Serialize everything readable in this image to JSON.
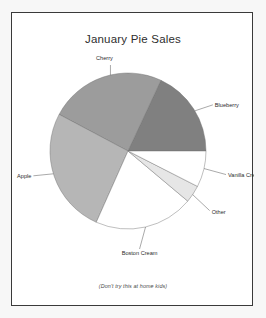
{
  "figure": {
    "title": "January Pie Sales",
    "footnote": "(Don't try this at home kids)",
    "background": "#f7f7f7",
    "panel_background": "#ffffff",
    "border_color": "#3a3a3a"
  },
  "chart_data": {
    "type": "pie",
    "title": "January Pie Sales",
    "annotations": [
      "(Don't try this at home kids)"
    ],
    "legend": "none",
    "labels_position": "outside-with-leader-lines",
    "start_angle": 0,
    "direction": "counterclockwise",
    "categories": [
      "Blueberry",
      "Cherry",
      "Apple",
      "Boston Cream",
      "Other",
      "Vanilla Cream"
    ],
    "values": [
      18,
      24,
      26,
      20.5,
      3.5,
      8
    ],
    "units": "percent",
    "slices": [
      {
        "label": "Blueberry",
        "value": 18,
        "start_angle": 0,
        "end_angle": 65,
        "color": "#808080"
      },
      {
        "label": "Cherry",
        "value": 24,
        "start_angle": 65,
        "end_angle": 152,
        "color": "#9c9c9c"
      },
      {
        "label": "Apple",
        "value": 26,
        "start_angle": 152,
        "end_angle": 246,
        "color": "#b6b6b6"
      },
      {
        "label": "Boston Cream",
        "value": 20.5,
        "start_angle": 246,
        "end_angle": 320,
        "color": "#ffffff"
      },
      {
        "label": "Other",
        "value": 3.5,
        "start_angle": 320,
        "end_angle": 333,
        "color": "#e6e6e6"
      },
      {
        "label": "Vanilla Cream",
        "value": 8,
        "start_angle": 333,
        "end_angle": 360,
        "color": "#ffffff"
      }
    ]
  }
}
